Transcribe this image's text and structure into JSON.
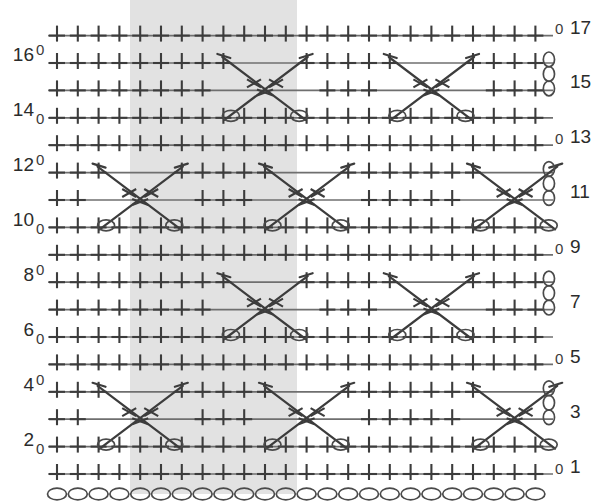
{
  "chart": {
    "kind": "stitch-chart",
    "colors": {
      "background": "#ffffff",
      "repeat_band": "#e2e2e2",
      "symbol_dark": "#3c3c3c",
      "symbol_light": "#6f6f6f",
      "label": "#2b2b2b"
    },
    "geometry": {
      "width": 594,
      "height": 502,
      "grid_left": 57,
      "grid_right": 549,
      "column_pitch": 20.8,
      "columns": 24,
      "rows": 17,
      "row_pitch": 27.4,
      "row_one_baseline": 474
    },
    "repeat_band": {
      "label": "pattern repeat",
      "x_start": 130,
      "x_end": 297,
      "y_start": 0,
      "y_end": 494
    },
    "row_numbers_left": [
      "16",
      "14",
      "12",
      "10",
      "8",
      "6",
      "4",
      "2"
    ],
    "row_numbers_right": [
      "17",
      "15",
      "13",
      "11",
      "9",
      "7",
      "5",
      "3",
      "1"
    ],
    "left_labels": [
      {
        "text": "16",
        "row": 16,
        "y": 45
      },
      {
        "text": "14",
        "row": 14,
        "y": 100
      },
      {
        "text": "12",
        "row": 12,
        "y": 155
      },
      {
        "text": "10",
        "row": 10,
        "y": 210
      },
      {
        "text": "8",
        "row": 8,
        "y": 265
      },
      {
        "text": "6",
        "row": 6,
        "y": 320
      },
      {
        "text": "4",
        "row": 4,
        "y": 375
      },
      {
        "text": "2",
        "row": 2,
        "y": 430
      }
    ],
    "right_labels": [
      {
        "text": "17",
        "row": 17,
        "y": 18
      },
      {
        "text": "15",
        "row": 15,
        "y": 72
      },
      {
        "text": "13",
        "row": 13,
        "y": 127
      },
      {
        "text": "11",
        "row": 11,
        "y": 182
      },
      {
        "text": "9",
        "row": 9,
        "y": 237
      },
      {
        "text": "7",
        "row": 7,
        "y": 292
      },
      {
        "text": "5",
        "row": 5,
        "y": 347
      },
      {
        "text": "3",
        "row": 3,
        "y": 402
      },
      {
        "text": "1",
        "row": 1,
        "y": 457
      }
    ],
    "turn_zeros_left": [
      {
        "text": "0",
        "x": 36,
        "y": 42
      },
      {
        "text": "0",
        "x": 36,
        "y": 111
      },
      {
        "text": "0",
        "x": 36,
        "y": 152
      },
      {
        "text": "0",
        "x": 36,
        "y": 221
      },
      {
        "text": "0",
        "x": 36,
        "y": 262
      },
      {
        "text": "0",
        "x": 36,
        "y": 331
      },
      {
        "text": "0",
        "x": 36,
        "y": 372
      },
      {
        "text": "0",
        "x": 36,
        "y": 441
      }
    ],
    "turn_zeros_right": [
      {
        "text": "0",
        "x": 555,
        "y": 21
      },
      {
        "text": "0",
        "x": 555,
        "y": 131
      },
      {
        "text": "0",
        "x": 555,
        "y": 241
      },
      {
        "text": "0",
        "x": 555,
        "y": 351
      },
      {
        "text": "0",
        "x": 555,
        "y": 461
      }
    ],
    "legend_keys": [
      {
        "symbol": "+",
        "name": "single-crochet-symbol",
        "meaning": "single crochet"
      },
      {
        "symbol": "oval",
        "name": "chain-stitch-symbol",
        "meaning": "chain stitch"
      },
      {
        "symbol": "X",
        "name": "cable-cross-symbol",
        "meaning": "crossed cable / front post treble cross"
      }
    ]
  },
  "chart_data": {
    "type": "heatmap",
    "subtitle": "",
    "xlabel": "",
    "ylabel": "row",
    "grid": true,
    "legend_position": "none",
    "axis": {
      "rows": 17,
      "columns": 24,
      "row_ticks_left": [
        2,
        4,
        6,
        8,
        10,
        12,
        14,
        16
      ],
      "row_ticks_right": [
        1,
        3,
        5,
        7,
        9,
        11,
        13,
        15,
        17
      ]
    },
    "symbol_legend": {
      "plus": "single crochet",
      "oval": "chain",
      "cross": "crossed cable cluster"
    },
    "foundation_chain": {
      "row": 0,
      "symbol": "oval",
      "count": 24
    },
    "turning_chains": [
      {
        "row": 3,
        "symbol": "oval",
        "count": 3,
        "side": "right"
      },
      {
        "row": 7,
        "symbol": "oval",
        "count": 3,
        "side": "right"
      },
      {
        "row": 11,
        "symbol": "oval",
        "count": 3,
        "side": "right"
      },
      {
        "row": 15,
        "symbol": "oval",
        "count": 3,
        "side": "right"
      }
    ],
    "plus_rows": [
      1,
      2,
      3,
      4,
      5,
      6,
      7,
      8,
      9,
      10,
      11,
      12,
      13,
      14,
      15,
      16,
      17
    ],
    "cable_groups": [
      {
        "name": "cables-rows-14-16",
        "row_span": [
          14,
          16
        ],
        "center_columns": [
          10,
          18
        ]
      },
      {
        "name": "cables-rows-10-12",
        "row_span": [
          10,
          12
        ],
        "center_columns": [
          4,
          12,
          22
        ]
      },
      {
        "name": "cables-rows-6-8",
        "row_span": [
          6,
          8
        ],
        "center_columns": [
          10,
          18
        ]
      },
      {
        "name": "cables-rows-2-4",
        "row_span": [
          2,
          4
        ],
        "center_columns": [
          4,
          12,
          22
        ]
      }
    ],
    "repeat_band_columns": [
      4,
      11
    ]
  }
}
